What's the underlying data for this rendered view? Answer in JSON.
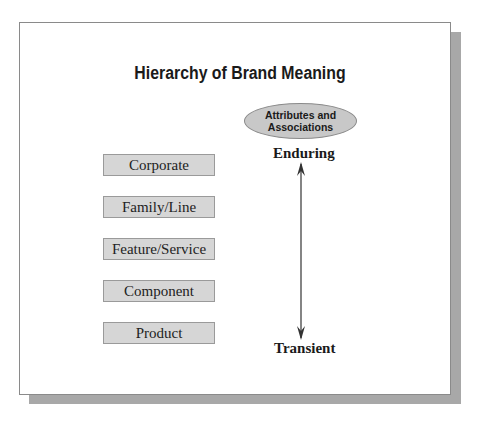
{
  "diagram": {
    "title": "Hierarchy of Brand Meaning",
    "levels": [
      {
        "label": "Corporate"
      },
      {
        "label": "Family/Line"
      },
      {
        "label": "Feature/Service"
      },
      {
        "label": "Component"
      },
      {
        "label": "Product"
      }
    ],
    "ellipse": {
      "line1": "Attributes and",
      "line2": "Associations"
    },
    "axis": {
      "top_label": "Enduring",
      "bottom_label": "Transient"
    },
    "colors": {
      "box_fill": "#d6d6d6",
      "ellipse_fill": "#c8c8c8",
      "shadow": "#a8a8a8"
    }
  }
}
